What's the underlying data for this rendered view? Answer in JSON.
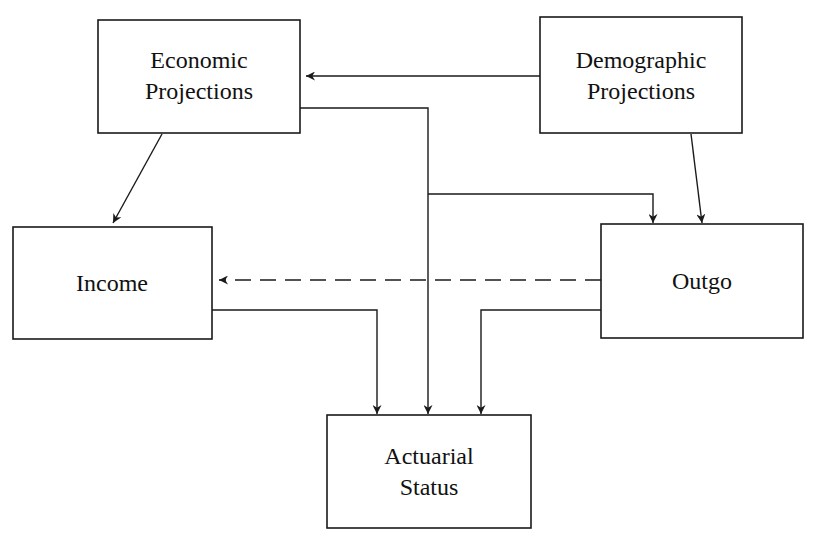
{
  "diagram": {
    "type": "flowchart",
    "nodes": [
      {
        "id": "economic",
        "lines": [
          "Economic",
          "Projections"
        ]
      },
      {
        "id": "demographic",
        "lines": [
          "Demographic",
          "Projections"
        ]
      },
      {
        "id": "income",
        "lines": [
          "Income"
        ]
      },
      {
        "id": "outgo",
        "lines": [
          "Outgo"
        ]
      },
      {
        "id": "actuarial",
        "lines": [
          "Actuarial",
          "Status"
        ]
      }
    ],
    "edges": [
      {
        "from": "demographic",
        "to": "economic",
        "style": "solid"
      },
      {
        "from": "economic",
        "to": "income",
        "style": "solid"
      },
      {
        "from": "economic",
        "to": "actuarial",
        "style": "solid"
      },
      {
        "from": "economic",
        "to": "outgo",
        "style": "solid"
      },
      {
        "from": "demographic",
        "to": "outgo",
        "style": "solid"
      },
      {
        "from": "outgo",
        "to": "income",
        "style": "dashed"
      },
      {
        "from": "income",
        "to": "actuarial",
        "style": "solid"
      },
      {
        "from": "outgo",
        "to": "actuarial",
        "style": "solid"
      }
    ],
    "colors": {
      "stroke": "#1a1a1a",
      "background": "#ffffff"
    }
  }
}
